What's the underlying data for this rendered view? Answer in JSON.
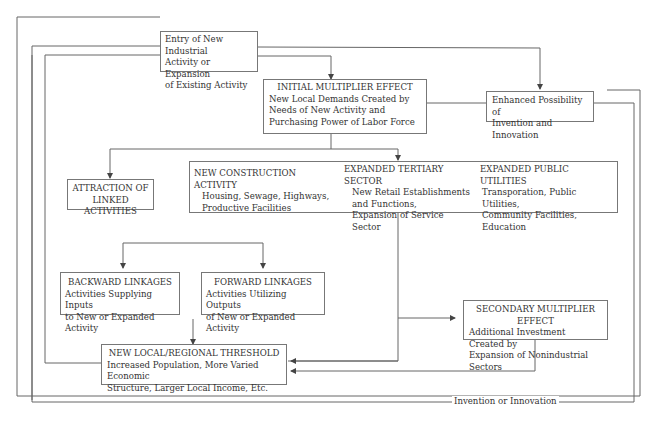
{
  "diagram": {
    "nodes": {
      "entry": {
        "lines": [
          "Entry of New Industrial",
          "Activity or Expansion",
          "of Existing Activity"
        ]
      },
      "initial_multiplier": {
        "title": "INITIAL MULTIPLIER EFFECT",
        "lines": [
          "New Local Demands Created by",
          "Needs of New Activity and",
          "Purchasing Power of Labor Force"
        ]
      },
      "enhanced_possibility": {
        "lines": [
          "Enhanced Possibility of",
          "Invention and Innovation"
        ]
      },
      "attraction": {
        "lines": [
          "ATTRACTION OF",
          "LINKED ACTIVITIES"
        ]
      },
      "sectors": {
        "construction": {
          "title": "NEW CONSTRUCTION ACTIVITY",
          "lines": [
            "Housing, Sewage, Highways,",
            "Productive Facilities"
          ]
        },
        "tertiary": {
          "title": "EXPANDED TERTIARY SECTOR",
          "lines": [
            "New Retail Establishments",
            "and Functions,",
            "Expansion of Service Sector"
          ]
        },
        "utilities": {
          "title": "EXPANDED PUBLIC UTILITIES",
          "lines": [
            "Transporation, Public Utilities,",
            "Community Facilities,",
            "Education"
          ]
        }
      },
      "backward": {
        "title": "BACKWARD LINKAGES",
        "lines": [
          "Activities Supplying Inputs",
          "to New or Expanded Activity"
        ]
      },
      "forward": {
        "title": "FORWARD LINKAGES",
        "lines": [
          "Activities Utilizing Outputs",
          "of New or Expanded Activity"
        ]
      },
      "secondary_multiplier": {
        "title": "SECONDARY MULTIPLIER EFFECT",
        "lines": [
          "Additional Investment Created by",
          "Expansion of Nonindustrial Sectors"
        ]
      },
      "threshold": {
        "title": "NEW LOCAL/REGIONAL THRESHOLD",
        "lines": [
          "Increased Population, More Varied Economic",
          "Structure, Larger Local Income, Etc."
        ]
      }
    },
    "edge_labels": {
      "invention": "Invention or Innovation"
    },
    "colors": {
      "line": "#555555",
      "border": "#777777",
      "text": "#333333",
      "background": "#ffffff"
    }
  }
}
